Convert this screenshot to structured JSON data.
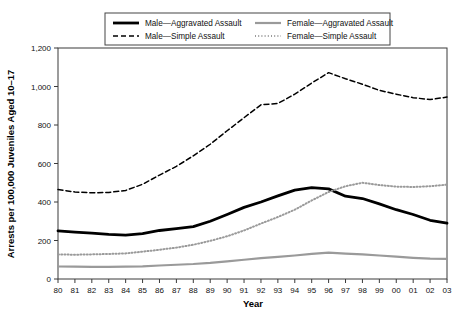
{
  "chart_data": {
    "type": "line",
    "title": "",
    "xlabel": "Year",
    "ylabel": "Arrests per 100,000 Juveniles Aged 10–17",
    "xlim": [
      1980,
      2003
    ],
    "ylim": [
      0,
      1200
    ],
    "ytick_values": [
      0,
      200,
      400,
      600,
      800,
      1000,
      1200
    ],
    "ytick_labels": [
      "0",
      "200",
      "400",
      "600",
      "800",
      "1,000",
      "1,200"
    ],
    "grid": false,
    "legend_position": "top-center",
    "x": [
      1980,
      1981,
      1982,
      1983,
      1984,
      1985,
      1986,
      1987,
      1988,
      1989,
      1990,
      1991,
      1992,
      1993,
      1994,
      1995,
      1996,
      1997,
      1998,
      1999,
      2000,
      2001,
      2002,
      2003
    ],
    "xtick_labels": [
      "80",
      "81",
      "82",
      "83",
      "84",
      "85",
      "86",
      "87",
      "88",
      "89",
      "90",
      "91",
      "92",
      "93",
      "94",
      "95",
      "96",
      "97",
      "98",
      "99",
      "00",
      "01",
      "02",
      "03"
    ],
    "series": [
      {
        "name": "Male—Aggravated Assault",
        "key": "male-aggravated-assault",
        "color": "#000000",
        "width": 2.8,
        "dash": "none",
        "values": [
          250,
          243,
          238,
          232,
          228,
          236,
          252,
          262,
          272,
          300,
          335,
          372,
          400,
          432,
          462,
          475,
          468,
          430,
          418,
          390,
          360,
          335,
          305,
          290
        ]
      },
      {
        "name": "Male—Simple Assault",
        "key": "male-simple-assault",
        "color": "#000000",
        "width": 1.5,
        "dash": "5,3",
        "values": [
          465,
          452,
          448,
          450,
          460,
          492,
          540,
          585,
          640,
          700,
          770,
          838,
          905,
          912,
          960,
          1018,
          1072,
          1040,
          1012,
          980,
          960,
          942,
          932,
          945
        ]
      },
      {
        "name": "Female—Aggravated Assault",
        "key": "female-aggravated-assault",
        "color": "#9a9a9a",
        "width": 2.2,
        "dash": "none",
        "values": [
          65,
          64,
          63,
          63,
          64,
          66,
          70,
          74,
          78,
          84,
          92,
          100,
          108,
          115,
          122,
          130,
          137,
          132,
          128,
          122,
          116,
          110,
          106,
          105
        ]
      },
      {
        "name": "Female—Simple Assault",
        "key": "female-simple-assault",
        "color": "#9a9a9a",
        "width": 2.0,
        "dash": "1,2.2",
        "values": [
          128,
          126,
          128,
          130,
          133,
          142,
          152,
          163,
          178,
          198,
          222,
          252,
          288,
          322,
          360,
          408,
          452,
          482,
          500,
          488,
          480,
          478,
          482,
          490
        ]
      }
    ]
  },
  "legend": {
    "entries": [
      {
        "label": "Male—Aggravated Assault",
        "key": "male-aggravated-assault"
      },
      {
        "label": "Female—Aggravated Assault",
        "key": "female-aggravated-assault"
      },
      {
        "label": "Male—Simple Assault",
        "key": "male-simple-assault"
      },
      {
        "label": "Female—Simple Assault",
        "key": "female-simple-assault"
      }
    ]
  }
}
